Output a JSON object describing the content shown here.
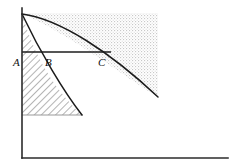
{
  "figure": {
    "width": 237,
    "height": 168,
    "background_color": "#ffffff",
    "ink_color": "#1c1c1c",
    "axis_color": "#2b2b2b",
    "stipple_fill_color": "#d8d8d8",
    "hatch_fill_color": "#7a7a7a"
  },
  "axes": {
    "y_axis": {
      "name": "vertical-axis",
      "x": 22,
      "y_top": 8,
      "y_bottom": 158
    },
    "x_axis": {
      "name": "horizontal-axis",
      "y": 158,
      "x_left": 22,
      "x_right": 228
    }
  },
  "curves": [
    {
      "name": "inner-curve",
      "start": [
        22,
        14
      ],
      "end": [
        82,
        115
      ],
      "control": [
        38,
        68
      ],
      "description": "steep inner boundary curve"
    },
    {
      "name": "outer-curve",
      "start": [
        22,
        14
      ],
      "end": [
        158,
        97
      ],
      "control": [
        78,
        28
      ],
      "description": "shallow outer boundary curve"
    }
  ],
  "level_line": {
    "name": "horizontal-level-line",
    "y": 52,
    "x_start": 22,
    "x_end": 111
  },
  "regions": [
    {
      "name": "stippled-region",
      "pattern": "stipple",
      "left": 22,
      "top": 13,
      "right": 158,
      "description": "dotted shaded area above the outer curve"
    },
    {
      "name": "hatched-region",
      "pattern": "diagonal-hatch",
      "left": 22,
      "bottom": 115,
      "description": "diagonally hatched area left of the inner curve"
    }
  ],
  "labels": [
    {
      "text": "A",
      "x": 13,
      "y": 66,
      "name": "point-label-a"
    },
    {
      "text": "B",
      "x": 45,
      "y": 66,
      "name": "point-label-b"
    },
    {
      "text": "C",
      "x": 98,
      "y": 66,
      "name": "point-label-c"
    }
  ]
}
